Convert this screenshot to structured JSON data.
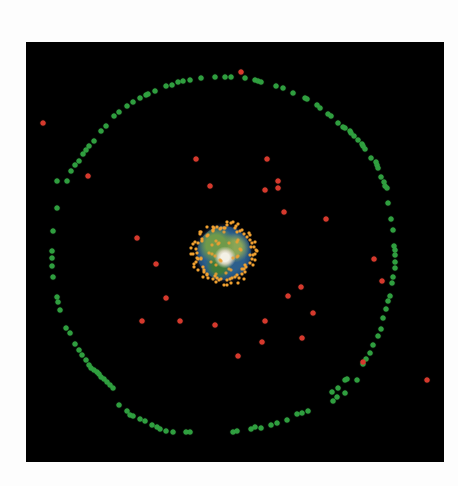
{
  "scene": {
    "title": "",
    "frame": {
      "left": 26,
      "top": 42,
      "width": 418,
      "height": 420,
      "background": "#000000"
    },
    "colors": {
      "page_background": "#fdfdfd",
      "space": "#000000",
      "geo_ring_satellites": "#2f9e3f",
      "mid_orbit_objects": "#d6392d",
      "low_orbit_objects": "#f0a030"
    },
    "earth": {
      "center": [
        224,
        253
      ],
      "radius": 27,
      "label": ""
    },
    "legend": []
  },
  "chart_data": {
    "type": "scatter",
    "title": "",
    "xlabel": "",
    "ylabel": "",
    "grid": false,
    "legend_position": "none",
    "series": [
      {
        "name": "green ring objects",
        "color": "#2f9e3f",
        "points": [
          [
            57,
            181
          ],
          [
            71,
            171
          ],
          [
            75,
            165
          ],
          [
            79,
            161
          ],
          [
            83,
            154
          ],
          [
            86,
            150
          ],
          [
            89,
            146
          ],
          [
            94,
            141
          ],
          [
            101,
            131
          ],
          [
            106,
            126
          ],
          [
            114,
            116
          ],
          [
            119,
            112
          ],
          [
            127,
            106
          ],
          [
            133,
            102
          ],
          [
            140,
            98
          ],
          [
            146,
            95
          ],
          [
            148,
            94
          ],
          [
            155,
            91
          ],
          [
            166,
            86
          ],
          [
            172,
            85
          ],
          [
            178,
            82
          ],
          [
            183,
            81
          ],
          [
            190,
            80
          ],
          [
            201,
            78
          ],
          [
            215,
            77
          ],
          [
            225,
            77
          ],
          [
            231,
            77
          ],
          [
            245,
            78
          ],
          [
            255,
            80
          ],
          [
            258,
            81
          ],
          [
            261,
            82
          ],
          [
            276,
            86
          ],
          [
            283,
            88
          ],
          [
            293,
            93
          ],
          [
            305,
            98
          ],
          [
            307,
            99
          ],
          [
            317,
            105
          ],
          [
            320,
            108
          ],
          [
            328,
            114
          ],
          [
            331,
            116
          ],
          [
            338,
            123
          ],
          [
            343,
            127
          ],
          [
            345,
            128
          ],
          [
            350,
            131
          ],
          [
            351,
            133
          ],
          [
            354,
            136
          ],
          [
            358,
            140
          ],
          [
            362,
            144
          ],
          [
            363,
            146
          ],
          [
            365,
            149
          ],
          [
            371,
            158
          ],
          [
            376,
            162
          ],
          [
            377,
            165
          ],
          [
            378,
            168
          ],
          [
            381,
            177
          ],
          [
            384,
            182
          ],
          [
            385,
            186
          ],
          [
            387,
            188
          ],
          [
            388,
            203
          ],
          [
            391,
            219
          ],
          [
            393,
            230
          ],
          [
            394,
            246
          ],
          [
            395,
            250
          ],
          [
            395,
            255
          ],
          [
            395,
            262
          ],
          [
            395,
            268
          ],
          [
            393,
            277
          ],
          [
            392,
            283
          ],
          [
            390,
            296
          ],
          [
            388,
            301
          ],
          [
            386,
            309
          ],
          [
            383,
            318
          ],
          [
            381,
            329
          ],
          [
            378,
            336
          ],
          [
            373,
            345
          ],
          [
            370,
            353
          ],
          [
            366,
            359
          ],
          [
            363,
            364
          ],
          [
            357,
            380
          ],
          [
            345,
            393
          ],
          [
            337,
            397
          ],
          [
            333,
            401
          ],
          [
            233,
            432
          ],
          [
            237,
            431
          ],
          [
            251,
            429
          ],
          [
            255,
            427
          ],
          [
            261,
            428
          ],
          [
            271,
            425
          ],
          [
            277,
            423
          ],
          [
            287,
            420
          ],
          [
            297,
            414
          ],
          [
            302,
            413
          ],
          [
            308,
            411
          ],
          [
            332,
            392
          ],
          [
            338,
            388
          ],
          [
            345,
            380
          ],
          [
            347,
            379
          ],
          [
            60,
            310
          ],
          [
            66,
            328
          ],
          [
            70,
            333
          ],
          [
            75,
            344
          ],
          [
            79,
            350
          ],
          [
            82,
            355
          ],
          [
            86,
            360
          ],
          [
            89,
            365
          ],
          [
            91,
            368
          ],
          [
            94,
            370
          ],
          [
            97,
            372
          ],
          [
            99,
            374
          ],
          [
            101,
            377
          ],
          [
            104,
            379
          ],
          [
            107,
            382
          ],
          [
            110,
            385
          ],
          [
            113,
            388
          ],
          [
            119,
            405
          ],
          [
            127,
            411
          ],
          [
            130,
            415
          ],
          [
            133,
            416
          ],
          [
            140,
            419
          ],
          [
            145,
            421
          ],
          [
            152,
            425
          ],
          [
            157,
            427
          ],
          [
            160,
            429
          ],
          [
            166,
            431
          ],
          [
            173,
            432
          ],
          [
            186,
            432
          ],
          [
            190,
            432
          ],
          [
            67,
            181
          ],
          [
            57,
            208
          ],
          [
            53,
            231
          ],
          [
            52,
            251
          ],
          [
            52,
            258
          ],
          [
            52,
            266
          ],
          [
            53,
            277
          ],
          [
            57,
            297
          ],
          [
            58,
            302
          ]
        ]
      },
      {
        "name": "red scattered objects",
        "color": "#d6392d",
        "points": [
          [
            43,
            123
          ],
          [
            88,
            176
          ],
          [
            196,
            159
          ],
          [
            210,
            186
          ],
          [
            137,
            238
          ],
          [
            241,
            72
          ],
          [
            267,
            159
          ],
          [
            278,
            181
          ],
          [
            265,
            190
          ],
          [
            278,
            188
          ],
          [
            284,
            212
          ],
          [
            326,
            219
          ],
          [
            156,
            264
          ],
          [
            166,
            298
          ],
          [
            142,
            321
          ],
          [
            180,
            321
          ],
          [
            215,
            325
          ],
          [
            374,
            259
          ],
          [
            382,
            281
          ],
          [
            301,
            287
          ],
          [
            288,
            296
          ],
          [
            313,
            313
          ],
          [
            265,
            321
          ],
          [
            262,
            342
          ],
          [
            302,
            338
          ],
          [
            238,
            356
          ],
          [
            363,
            362
          ],
          [
            427,
            380
          ]
        ]
      },
      {
        "name": "orange low-orbit halo",
        "color": "#f0a030",
        "ring": {
          "center": [
            224,
            253
          ],
          "inner_radius": 24,
          "outer_radius": 33,
          "count": 90
        }
      }
    ]
  }
}
